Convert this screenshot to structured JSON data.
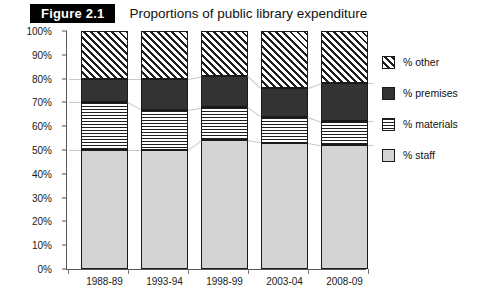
{
  "header": {
    "figure_badge": "Figure 2.1",
    "title": "Proportions of public library expenditure"
  },
  "chart_data": {
    "type": "bar",
    "stacked": true,
    "stack_mode": "percent",
    "title": "Proportions of public library expenditure",
    "xlabel": "",
    "ylabel": "",
    "ylim": [
      0,
      100
    ],
    "grid": false,
    "legend_position": "right",
    "categories": [
      "1988-89",
      "1993-94",
      "1998-99",
      "2003-04",
      "2008-09"
    ],
    "ytick_labels": [
      "0%",
      "10%",
      "20%",
      "30%",
      "40%",
      "50%",
      "60%",
      "70%",
      "80%",
      "90%",
      "100%"
    ],
    "ytick_values": [
      0,
      10,
      20,
      30,
      40,
      50,
      60,
      70,
      80,
      90,
      100
    ],
    "series": [
      {
        "name": "% staff",
        "pattern": "solid-light-gray",
        "color": "#d4d4d4",
        "values": [
          50,
          50,
          54,
          53,
          52
        ]
      },
      {
        "name": "% materials",
        "pattern": "horizontal-dotted",
        "color": "#ffffff",
        "values": [
          20,
          17,
          14,
          11,
          10
        ]
      },
      {
        "name": "% premises",
        "pattern": "solid-dark",
        "color": "#333333",
        "values": [
          10,
          13,
          13,
          12,
          16
        ]
      },
      {
        "name": "% other",
        "pattern": "diagonal-hatch",
        "color": "#ffffff",
        "values": [
          20,
          20,
          19,
          24,
          22
        ]
      }
    ],
    "legend": [
      {
        "label": "% other",
        "swatch": "diagonal-hatch"
      },
      {
        "label": "% premises",
        "swatch": "solid-dark"
      },
      {
        "label": "% materials",
        "swatch": "horizontal-dotted"
      },
      {
        "label": "% staff",
        "swatch": "solid-light-gray"
      }
    ]
  }
}
